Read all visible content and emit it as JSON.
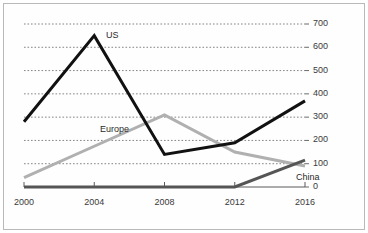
{
  "chart_data": {
    "type": "line",
    "title": "",
    "subtitle": "",
    "xlabel": "",
    "ylabel": "",
    "x": [
      2000,
      2004,
      2008,
      2012,
      2016
    ],
    "categories": [
      "2000",
      "2004",
      "2008",
      "2012",
      "2016"
    ],
    "xlim": [
      2000,
      2016
    ],
    "ylim": [
      0,
      700
    ],
    "y_ticks": [
      0,
      100,
      200,
      300,
      400,
      500,
      600,
      700
    ],
    "y_tick_labels": [
      "0",
      "100",
      "200",
      "300",
      "400",
      "500",
      "600",
      "700"
    ],
    "x_ticks": [
      2000,
      2004,
      2008,
      2012,
      2016
    ],
    "x_tick_labels": [
      "2000",
      "2004",
      "2008",
      "2012",
      "2016"
    ],
    "grid": "horizontal-dotted",
    "y_axis_position": "right",
    "legend": "inline-labels",
    "series": [
      {
        "name": "US",
        "label": "US",
        "color": "#111111",
        "width": 3,
        "values": [
          280,
          650,
          140,
          190,
          370
        ]
      },
      {
        "name": "Europe",
        "label": "Europe",
        "color": "#b0b0b0",
        "width": 3,
        "values": [
          40,
          175,
          310,
          150,
          90
        ]
      },
      {
        "name": "China",
        "label": "China",
        "color": "#555555",
        "width": 3,
        "values": [
          0,
          0,
          0,
          0,
          115
        ]
      }
    ],
    "annotations": [
      {
        "text": "US",
        "x": 2004,
        "y": 650
      },
      {
        "text": "Europe",
        "x": 2003,
        "y": 230
      },
      {
        "text": "China",
        "x": 2014,
        "y": 35
      }
    ]
  },
  "axis": {
    "y_labels": [
      "700",
      "600",
      "500",
      "400",
      "300",
      "200",
      "100",
      "0"
    ],
    "x_labels": [
      "2000",
      "2004",
      "2008",
      "2012",
      "2016"
    ]
  },
  "labels": {
    "us": "US",
    "europe": "Europe",
    "china": "China"
  },
  "colors": {
    "us": "#111111",
    "europe": "#b0b0b0",
    "china": "#555555",
    "grid": "#777777",
    "axis": "#5a5a5a",
    "border": "#b9b9b9",
    "background": "#ffffff"
  }
}
